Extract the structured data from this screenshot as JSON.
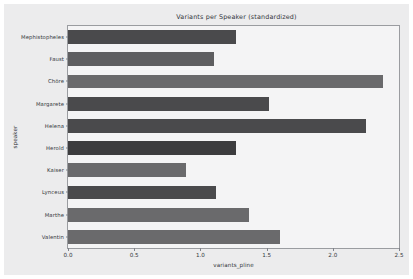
{
  "chart_data": {
    "type": "bar",
    "orientation": "horizontal",
    "title": "Variants per Speaker (standardized)",
    "xlabel": "variants_pline",
    "ylabel": "speaker",
    "xlim": [
      0.0,
      2.5
    ],
    "xticks": [
      "0.0",
      "0.5",
      "1.0",
      "1.5",
      "2.0",
      "2.5"
    ],
    "xtick_values": [
      0.0,
      0.5,
      1.0,
      1.5,
      2.0,
      2.5
    ],
    "grid": false,
    "legend": "none",
    "categories": [
      "Mephistopheles",
      "Faust",
      "Chöre",
      "Margarete",
      "Helena",
      "Herold",
      "Kaiser",
      "Lynceus",
      "Marthe",
      "Valentin"
    ],
    "values": [
      1.27,
      1.1,
      2.38,
      1.52,
      2.25,
      1.27,
      0.89,
      1.12,
      1.37,
      1.6
    ],
    "bars": [
      {
        "label": "Mephistopheles",
        "value": 1.27,
        "color": "#4a4a4c"
      },
      {
        "label": "Faust",
        "value": 1.1,
        "color": "#5e5e60"
      },
      {
        "label": "Chöre",
        "value": 2.38,
        "color": "#6a6a6c"
      },
      {
        "label": "Margarete",
        "value": 1.52,
        "color": "#4a4a4c"
      },
      {
        "label": "Helena",
        "value": 2.25,
        "color": "#4a4a4c"
      },
      {
        "label": "Herold",
        "value": 1.27,
        "color": "#3c3c3e"
      },
      {
        "label": "Kaiser",
        "value": 0.89,
        "color": "#6a6a6c"
      },
      {
        "label": "Lynceus",
        "value": 1.12,
        "color": "#4a4a4c"
      },
      {
        "label": "Marthe",
        "value": 1.37,
        "color": "#6a6a6c"
      },
      {
        "label": "Valentin",
        "value": 1.6,
        "color": "#6a6a6c"
      }
    ],
    "colors": {
      "figure_background": "#ececed",
      "axes_background": "#f4f4f5",
      "axes_border": "#9a9ca0",
      "text": "#33363b"
    }
  }
}
